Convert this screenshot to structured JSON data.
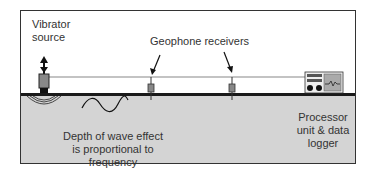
{
  "diagram": {
    "labels": {
      "source": [
        "Vibrator",
        "source"
      ],
      "receivers": "Geophone receivers",
      "depth": [
        "Depth of wave effect",
        "is proportional to frequency"
      ],
      "processor": [
        "Processor",
        "unit & data",
        "logger"
      ]
    },
    "colors": {
      "ground": "#d4d4d4",
      "surface_line": "#1a1a1a",
      "device_body": "#888888",
      "text": "#333333"
    }
  }
}
